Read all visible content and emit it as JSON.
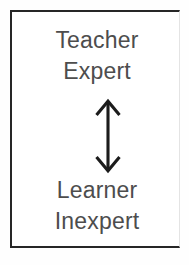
{
  "diagram": {
    "frame": {
      "border_color": "#262626",
      "background_color": "#ffffff"
    },
    "top_label": {
      "line1": "Teacher",
      "line2": "Expert"
    },
    "bottom_label": {
      "line1": "Learner",
      "line2": "Inexpert"
    },
    "connector": {
      "icon": "double-headed-vertical-arrow",
      "direction": "bidirectional",
      "orientation": "vertical",
      "color": "#1c1c1c"
    },
    "text_color": "#4d4d4d"
  }
}
